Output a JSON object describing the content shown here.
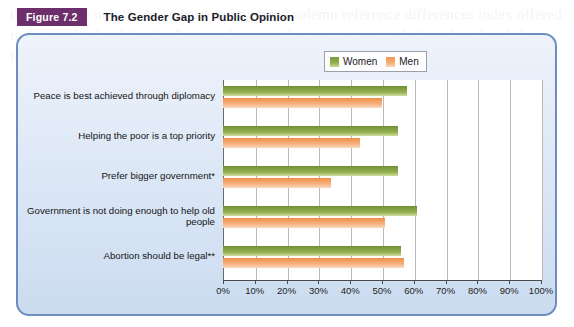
{
  "figure": {
    "badge": "Figure 7.2",
    "title": "The Gender Gap in Public Opinion"
  },
  "legend": {
    "position": "top-center",
    "items": [
      {
        "label": "Women",
        "color": "#8fae4c",
        "swatch": "women-swatch"
      },
      {
        "label": "Men",
        "color": "#f5ae72",
        "swatch": "men-swatch"
      }
    ]
  },
  "colors": {
    "badge_bg": "#6d2f6b",
    "panel_border": "#6d8dc0",
    "panel_bg": "#dfe9f7",
    "women": "#8fae4c",
    "men": "#f5ae72",
    "plot_bg": "#ffffff",
    "gridline": "#b9b9b9",
    "axis": "#4a4a4a"
  },
  "chart_data": {
    "type": "bar",
    "orientation": "horizontal",
    "title": "The Gender Gap in Public Opinion",
    "xlabel": "",
    "ylabel": "",
    "xlim": [
      0,
      100
    ],
    "xtick_labels": [
      "0%",
      "10%",
      "20%",
      "30%",
      "40%",
      "50%",
      "60%",
      "70%",
      "80%",
      "90%",
      "100%"
    ],
    "xticks": [
      0,
      10,
      20,
      30,
      40,
      50,
      60,
      70,
      80,
      90,
      100
    ],
    "grid": "vertical",
    "legend_position": "top-center",
    "categories": [
      "Peace is best achieved through diplomacy",
      "Helping the poor is a top priority",
      "Prefer bigger government*",
      "Government is not doing enough to help old people",
      "Abortion should be legal**"
    ],
    "series": [
      {
        "name": "Women",
        "color": "#8fae4c",
        "values": [
          58,
          55,
          55,
          61,
          56
        ]
      },
      {
        "name": "Men",
        "color": "#f5ae72",
        "values": [
          50,
          43,
          34,
          51,
          57
        ]
      }
    ]
  },
  "ghost_text": "the a and the neir made on hard and ny hand solemn reference differences index offered in fact multiple of the the Peace solemn on that matter to attach shared in the of this text and the of in the mind on the subject some shared others things"
}
